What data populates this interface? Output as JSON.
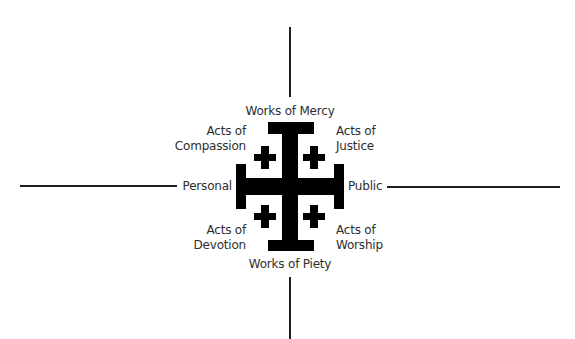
{
  "diagram": {
    "type": "quadrant-cross",
    "symbol": "jerusalem-cross",
    "colors": {
      "cross": "#000000",
      "lines": "#1e1e1e",
      "text": "#2e2e2e",
      "background": "#ffffff"
    },
    "axes": {
      "top": "Works of Mercy",
      "bottom": "Works of Piety",
      "left": "Personal",
      "right": "Public"
    },
    "quadrants": {
      "top_left": {
        "line1": "Acts of",
        "line2": "Compassion"
      },
      "top_right": {
        "line1": "Acts of",
        "line2": "Justice"
      },
      "bottom_left": {
        "line1": "Acts of",
        "line2": "Devotion"
      },
      "bottom_right": {
        "line1": "Acts of",
        "line2": "Worship"
      }
    }
  }
}
